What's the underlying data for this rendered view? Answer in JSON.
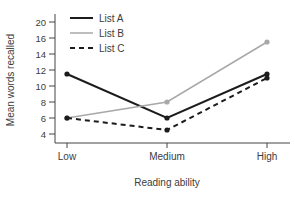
{
  "chart_data": {
    "type": "line",
    "title": "",
    "xlabel": "Reading ability",
    "ylabel": "Mean words recalled",
    "categories": [
      "Low",
      "Medium",
      "High"
    ],
    "y_tick_labels": [
      20,
      16,
      14,
      12,
      10,
      8,
      6,
      4
    ],
    "y_axis_note": "ticks evenly spaced; 18 unlabeled/skipped between 20 and 16",
    "grid": false,
    "legend_position": "top-left-inside",
    "series": [
      {
        "name": "List A",
        "values": [
          11.5,
          6,
          11.5
        ],
        "color": "#1c1c1c",
        "line_style": "solid",
        "line_width": 2,
        "marker": "circle"
      },
      {
        "name": "List B",
        "values": [
          6,
          8,
          15.5
        ],
        "color": "#a8a8a8",
        "line_style": "solid",
        "line_width": 1.5,
        "marker": "circle"
      },
      {
        "name": "List C",
        "values": [
          6,
          4.5,
          11
        ],
        "color": "#1c1c1c",
        "line_style": "dashed",
        "line_width": 2,
        "marker": "circle"
      }
    ],
    "colors": {
      "axis": "#444444",
      "text": "#3c3c3c",
      "background": "#ffffff"
    }
  }
}
